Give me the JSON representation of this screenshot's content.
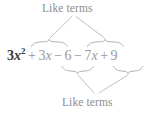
{
  "figure": {
    "type": "algebraic-expression-annotation",
    "background_color": "#ffffff",
    "annotation_color": "#9a9a9a",
    "expression_color": "#9a9a9a",
    "lead_term_color": "#3a3a3a"
  },
  "labels": {
    "top": "Like terms",
    "bottom": "Like terms"
  },
  "expression": {
    "full_text": "3x² + 3x − 6 − 7x + 9",
    "terms": [
      {
        "id": "t1",
        "sign": "",
        "coefficient": "3",
        "variable": "x",
        "exponent": "2",
        "display": "3x²",
        "bold": true,
        "grouped_as": "quadratic"
      },
      {
        "id": "t2",
        "sign": "+",
        "coefficient": "3",
        "variable": "x",
        "exponent": "",
        "display": "3x",
        "bold": false,
        "grouped_as": "like-terms-top"
      },
      {
        "id": "t3",
        "sign": "−",
        "coefficient": "6",
        "variable": "",
        "exponent": "",
        "display": "6",
        "bold": false,
        "grouped_as": "like-terms-bottom"
      },
      {
        "id": "t4",
        "sign": "−",
        "coefficient": "7",
        "variable": "x",
        "exponent": "",
        "display": "7x",
        "bold": false,
        "grouped_as": "like-terms-top"
      },
      {
        "id": "t5",
        "sign": "+",
        "coefficient": "9",
        "variable": "",
        "exponent": "",
        "display": "9",
        "bold": false,
        "grouped_as": "like-terms-bottom"
      }
    ],
    "pieces": [
      {
        "sign": "",
        "body_pre": "3",
        "var": "x",
        "sup": "2",
        "bold": true
      },
      {
        "sign": "+",
        "body_pre": "3",
        "var": "x",
        "sup": "",
        "bold": false
      },
      {
        "sign": "−",
        "body_pre": "6",
        "var": "",
        "sup": "",
        "bold": false
      },
      {
        "sign": "−",
        "body_pre": "7",
        "var": "x",
        "sup": "",
        "bold": false
      },
      {
        "sign": "+",
        "body_pre": "9",
        "var": "",
        "sup": "",
        "bold": false
      }
    ]
  },
  "braces": [
    {
      "name": "overbrace-plus-3x",
      "position": "above",
      "spans_terms": [
        "+ 3x"
      ]
    },
    {
      "name": "overbrace-minus-7x",
      "position": "above",
      "spans_terms": [
        "− 7x"
      ]
    },
    {
      "name": "underbrace-minus-6",
      "position": "below",
      "spans_terms": [
        "− 6"
      ]
    },
    {
      "name": "underbrace-plus-9",
      "position": "below",
      "spans_terms": [
        "+ 9"
      ]
    }
  ],
  "connectors": [
    {
      "name": "connector-top-left",
      "from": "label-top",
      "to": "overbrace-plus-3x"
    },
    {
      "name": "connector-top-right",
      "from": "label-top",
      "to": "overbrace-minus-7x"
    },
    {
      "name": "connector-bottom-left",
      "from": "underbrace-minus-6",
      "to": "label-bottom"
    },
    {
      "name": "connector-bottom-right",
      "from": "underbrace-plus-9",
      "to": "label-bottom"
    }
  ]
}
